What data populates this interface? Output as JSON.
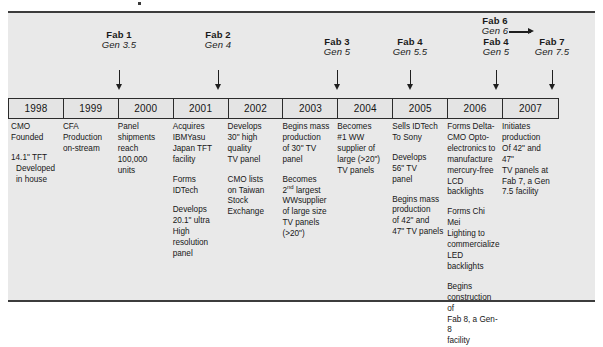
{
  "figure": {
    "background_color": "#e9e9e9",
    "border_color": "#3c3c3c"
  },
  "timeline": {
    "years": [
      "1998",
      "1999",
      "2000",
      "2001",
      "2002",
      "2003",
      "2004",
      "2005",
      "2006",
      "2007"
    ]
  },
  "fab_markers": [
    {
      "name": "Fab 1",
      "gen": "Gen 3.5",
      "arrow": "down"
    },
    {
      "name": "Fab 2",
      "gen": "Gen 4",
      "arrow": "down"
    },
    {
      "name": "Fab 3",
      "gen": "Gen 5",
      "arrow": "down"
    },
    {
      "name": "Fab 4",
      "gen": "Gen 5.5",
      "arrow": "down"
    },
    {
      "name": "Fab 6",
      "gen": "Gen 6",
      "arrow": "right"
    },
    {
      "name": "Fab 4",
      "gen": "Gen 5",
      "arrow": "down"
    },
    {
      "name": "Fab 7",
      "gen": "Gen 7.5",
      "arrow": "down"
    }
  ],
  "columns": [
    {
      "year": "1998",
      "events": [
        {
          "lines": [
            "CMO Founded"
          ],
          "indented": []
        },
        {
          "lines": [
            "14.1\" TFT"
          ],
          "indented": [
            "Developed",
            "in house"
          ]
        }
      ]
    },
    {
      "year": "1999",
      "events": [
        {
          "lines": [
            "CFA",
            "Production",
            "on-stream"
          ],
          "indented": []
        }
      ]
    },
    {
      "year": "2000",
      "events": [
        {
          "lines": [
            "Panel",
            "shipments",
            "reach",
            "100,000",
            "units"
          ],
          "indented": []
        }
      ]
    },
    {
      "year": "2001",
      "events": [
        {
          "lines": [
            "Acquires",
            "IBMYasu",
            "Japan TFT",
            "facility"
          ],
          "indented": []
        },
        {
          "lines": [
            "Forms",
            "IDTech"
          ],
          "indented": []
        },
        {
          "lines": [
            "Develops",
            "20.1\" ultra",
            "High resolution",
            "panel"
          ],
          "indented": []
        }
      ]
    },
    {
      "year": "2002",
      "events": [
        {
          "lines": [
            "Develops",
            "30\" high",
            "quality",
            "TV panel"
          ],
          "indented": []
        },
        {
          "lines": [
            "CMO lists",
            "on Taiwan",
            "Stock",
            "Exchange"
          ],
          "indented": []
        }
      ]
    },
    {
      "year": "2003",
      "events": [
        {
          "lines": [
            "Begins mass",
            "production",
            "of 30\" TV",
            "panel"
          ],
          "indented": []
        },
        {
          "lines": [
            "Becomes",
            "2nd largest",
            "WWsupplier",
            "of large size",
            "TV panels",
            "(>20\")"
          ],
          "indented": []
        }
      ]
    },
    {
      "year": "2004",
      "events": [
        {
          "lines": [
            "Becomes",
            "#1 WW",
            "supplier of",
            "large (>20\")",
            "TV panels"
          ],
          "indented": []
        }
      ]
    },
    {
      "year": "2005",
      "events": [
        {
          "lines": [
            "Sells IDTech",
            "To Sony"
          ],
          "indented": []
        },
        {
          "lines": [
            "Develops",
            "56\" TV",
            "panel"
          ],
          "indented": []
        },
        {
          "lines": [
            "Begins mass",
            "production",
            "of 42\" and",
            "47\" TV panels"
          ],
          "indented": []
        }
      ]
    },
    {
      "year": "2006",
      "events": [
        {
          "lines": [
            "Forms Delta-",
            "CMO Opto-",
            "electronics to",
            "manufacture",
            "mercury-free",
            "LCD backlights"
          ],
          "indented": []
        },
        {
          "lines": [
            "Forms Chi Mei",
            "Lighting to",
            "commercialize",
            "LED backlights"
          ],
          "indented": []
        },
        {
          "lines": [
            "Begins",
            "construction of",
            "Fab 8, a Gen-8",
            "facility"
          ],
          "indented": []
        }
      ]
    },
    {
      "year": "2007",
      "events": [
        {
          "lines": [
            "Initiates",
            "production",
            "Of 42\" and 47\"",
            "TV panels at",
            "Fab 7, a Gen",
            "7.5 facility"
          ],
          "indented": []
        }
      ]
    }
  ]
}
